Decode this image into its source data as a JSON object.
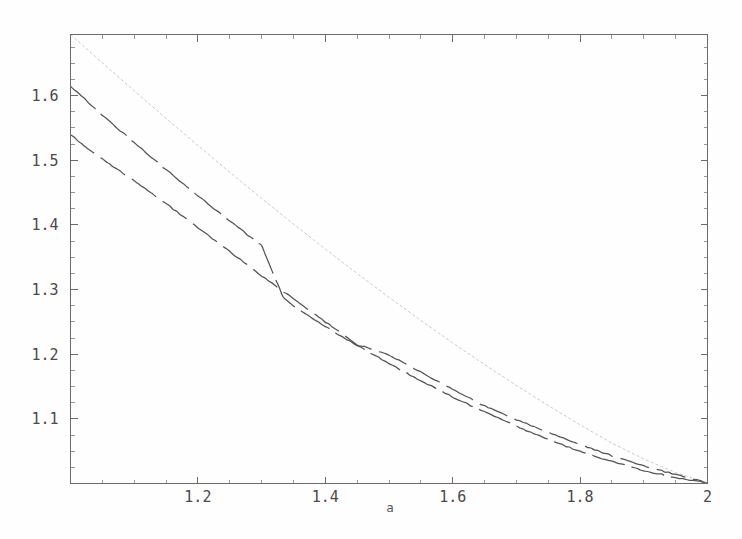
{
  "figure": {
    "background_color": "#fefefe",
    "frame_color": "#6b6b6b",
    "width": 742,
    "height": 539
  },
  "chart_data": {
    "type": "line",
    "title": "",
    "subtitle": "",
    "xlabel": "a",
    "ylabel": "",
    "xlim": [
      1.0,
      2.0
    ],
    "ylim": [
      1.0,
      1.6945
    ],
    "grid": false,
    "legend": null,
    "legend_position": "none",
    "x_ticks_major": [
      1.2,
      1.4,
      1.6,
      1.8,
      2.0
    ],
    "x_tick_labels": [
      "1.2",
      "1.4",
      "1.6",
      "1.8",
      "2"
    ],
    "x_ticks_minor": [
      1.05,
      1.1,
      1.15,
      1.25,
      1.3,
      1.35,
      1.45,
      1.5,
      1.55,
      1.65,
      1.7,
      1.75,
      1.85,
      1.9,
      1.95
    ],
    "y_ticks_major": [
      1.1,
      1.2,
      1.3,
      1.4,
      1.5,
      1.6
    ],
    "y_tick_labels": [
      "1.1",
      "1.2",
      "1.3",
      "1.4",
      "1.5",
      "1.6"
    ],
    "y_ticks_minor": [
      1.025,
      1.05,
      1.075,
      1.125,
      1.15,
      1.175,
      1.225,
      1.25,
      1.275,
      1.325,
      1.35,
      1.375,
      1.425,
      1.45,
      1.475,
      1.525,
      1.55,
      1.575,
      1.625,
      1.65,
      1.675
    ],
    "annotations": [],
    "series": [
      {
        "name": "upper-light-curve",
        "color": "#c9c9c9",
        "style": "fine-dotted",
        "stroke_width": 1.0,
        "dash": "3,2.2",
        "x": [
          1.0,
          1.05,
          1.1,
          1.15,
          1.2,
          1.25,
          1.3,
          1.35,
          1.4,
          1.45,
          1.5,
          1.55,
          1.6,
          1.65,
          1.7,
          1.75,
          1.8,
          1.85,
          1.9,
          1.95,
          2.0
        ],
        "values": [
          1.6945,
          1.6508,
          1.6075,
          1.5648,
          1.5228,
          1.4815,
          1.441,
          1.4014,
          1.3626,
          1.3248,
          1.288,
          1.2522,
          1.2175,
          1.184,
          1.1517,
          1.1206,
          1.0908,
          1.0624,
          1.038,
          1.0168,
          1.001
        ]
      },
      {
        "name": "middle-dark-curve",
        "color": "#555555",
        "style": "dashed",
        "stroke_width": 1.25,
        "dash": "34,7",
        "x": [
          1.0,
          1.05,
          1.1,
          1.15,
          1.2,
          1.25,
          1.3,
          1.3333,
          1.35,
          1.4,
          1.45,
          1.5,
          1.55,
          1.6,
          1.65,
          1.7,
          1.75,
          1.8,
          1.85,
          1.9,
          1.95,
          2.0
        ],
        "values": [
          1.6145,
          1.57,
          1.527,
          1.4855,
          1.4452,
          1.406,
          1.368,
          1.2895,
          1.2745,
          1.243,
          1.2135,
          1.1855,
          1.159,
          1.134,
          1.1105,
          1.0885,
          1.068,
          1.0495,
          1.034,
          1.02,
          1.009,
          1.001
        ]
      },
      {
        "name": "lower-dark-curve",
        "color": "#555555",
        "style": "dashed",
        "stroke_width": 1.25,
        "dash": "30,8",
        "x": [
          1.0,
          1.03,
          1.06,
          1.1,
          1.15,
          1.2,
          1.25,
          1.3,
          1.3333,
          1.35,
          1.4,
          1.45,
          1.5,
          1.55,
          1.6,
          1.65,
          1.7,
          1.75,
          1.8,
          1.85,
          1.9,
          1.95,
          2.0
        ],
        "values": [
          1.54,
          1.516,
          1.495,
          1.468,
          1.433,
          1.396,
          1.3585,
          1.3215,
          1.297,
          1.286,
          1.25,
          1.215,
          1.199,
          1.172,
          1.1455,
          1.12,
          1.0985,
          1.079,
          1.0605,
          1.043,
          1.0275,
          1.0135,
          1.001
        ]
      }
    ]
  },
  "axis_labels": {
    "x_axis_name": "a"
  }
}
